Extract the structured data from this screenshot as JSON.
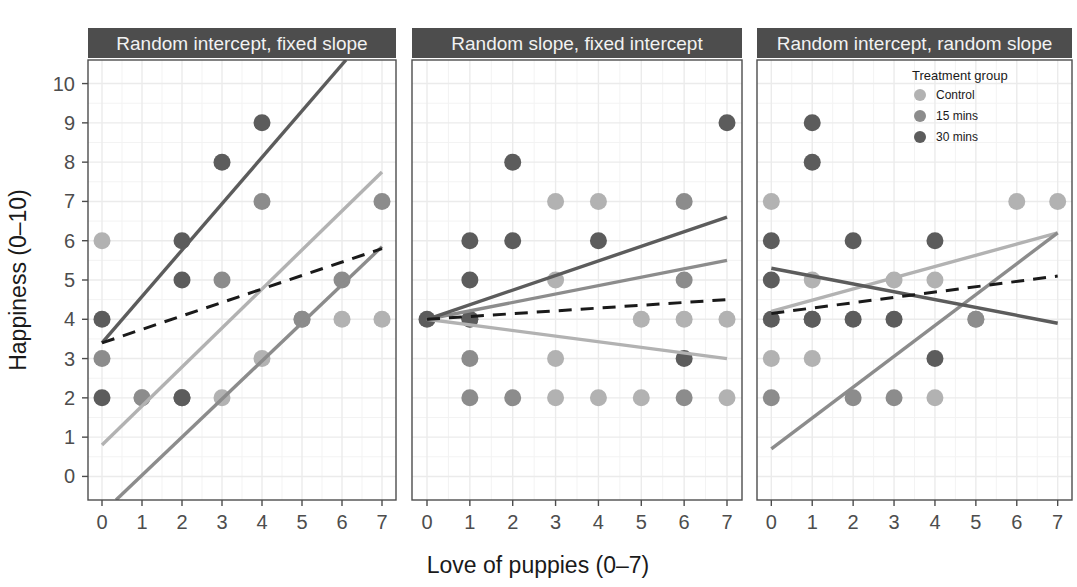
{
  "chart_data": {
    "type": "scatter",
    "title": "",
    "xlabel": "Love of puppies (0–7)",
    "ylabel": "Happiness (0–10)",
    "xlim": [
      -0.35,
      7.35
    ],
    "ylim": [
      -0.6,
      10.6
    ],
    "xticks": [
      0,
      1,
      2,
      3,
      4,
      5,
      6,
      7
    ],
    "yticks": [
      0,
      1,
      2,
      3,
      4,
      5,
      6,
      7,
      8,
      9,
      10
    ],
    "grid": true,
    "legend": {
      "position": "top-right-inside-panel-3",
      "title": "Treatment group",
      "entries": [
        {
          "label": "Control",
          "color": "#b2b2b2"
        },
        {
          "label": "15 mins",
          "color": "#8c8c8c"
        },
        {
          "label": "30 mins",
          "color": "#5c5c5c"
        }
      ]
    },
    "overall_line": {
      "label": "Overall fixed effect",
      "style": "dashed",
      "color": "#1a1a1a",
      "width": 3
    },
    "facets": [
      {
        "name": "panel-1",
        "title": "Random intercept, fixed slope",
        "series": [
          {
            "name": "Control",
            "color": "#b2b2b2",
            "points": [
              {
                "x": 0,
                "y": 6
              },
              {
                "x": 1,
                "y": 2
              },
              {
                "x": 2,
                "y": 2
              },
              {
                "x": 3,
                "y": 2
              },
              {
                "x": 4,
                "y": 3
              },
              {
                "x": 5,
                "y": 4
              },
              {
                "x": 6,
                "y": 4
              },
              {
                "x": 7,
                "y": 4
              }
            ],
            "line": {
              "x0": 0,
              "y0": 0.8,
              "x1": 7,
              "y1": 7.75
            }
          },
          {
            "name": "15 mins",
            "color": "#8c8c8c",
            "points": [
              {
                "x": 0,
                "y": 3
              },
              {
                "x": 1,
                "y": 2
              },
              {
                "x": 2,
                "y": 2
              },
              {
                "x": 3,
                "y": 5
              },
              {
                "x": 4,
                "y": 7
              },
              {
                "x": 5,
                "y": 4
              },
              {
                "x": 6,
                "y": 5
              },
              {
                "x": 7,
                "y": 7
              }
            ],
            "line": {
              "x0": 0.35,
              "y0": -0.6,
              "x1": 7,
              "y1": 5.85
            }
          },
          {
            "name": "30 mins",
            "color": "#5c5c5c",
            "points": [
              {
                "x": 0,
                "y": 4
              },
              {
                "x": 0,
                "y": 2
              },
              {
                "x": 2,
                "y": 6
              },
              {
                "x": 2,
                "y": 5
              },
              {
                "x": 3,
                "y": 8
              },
              {
                "x": 4,
                "y": 9
              },
              {
                "x": 2,
                "y": 2
              }
            ],
            "line": {
              "x0": 0,
              "y0": 3.4,
              "x1": 6.1,
              "y1": 10.6
            }
          }
        ],
        "overall": {
          "x0": 0,
          "y0": 3.4,
          "x1": 7,
          "y1": 5.8
        }
      },
      {
        "name": "panel-2",
        "title": "Random slope, fixed intercept",
        "series": [
          {
            "name": "Control",
            "color": "#b2b2b2",
            "points": [
              {
                "x": 1,
                "y": 4
              },
              {
                "x": 3,
                "y": 7
              },
              {
                "x": 4,
                "y": 7
              },
              {
                "x": 3,
                "y": 5
              },
              {
                "x": 5,
                "y": 4
              },
              {
                "x": 6,
                "y": 4
              },
              {
                "x": 7,
                "y": 4
              },
              {
                "x": 3,
                "y": 2
              },
              {
                "x": 4,
                "y": 2
              },
              {
                "x": 5,
                "y": 2
              },
              {
                "x": 7,
                "y": 2
              },
              {
                "x": 3,
                "y": 3
              }
            ],
            "line": {
              "x0": 0,
              "y0": 4.0,
              "x1": 7,
              "y1": 3.0
            }
          },
          {
            "name": "15 mins",
            "color": "#8c8c8c",
            "points": [
              {
                "x": 1,
                "y": 3
              },
              {
                "x": 6,
                "y": 7
              },
              {
                "x": 6,
                "y": 5
              },
              {
                "x": 2,
                "y": 2
              },
              {
                "x": 6,
                "y": 2
              },
              {
                "x": 1,
                "y": 2
              }
            ],
            "line": {
              "x0": 0,
              "y0": 4.0,
              "x1": 7,
              "y1": 5.5
            }
          },
          {
            "name": "30 mins",
            "color": "#5c5c5c",
            "points": [
              {
                "x": 0,
                "y": 4
              },
              {
                "x": 1,
                "y": 6
              },
              {
                "x": 1,
                "y": 5
              },
              {
                "x": 2,
                "y": 8
              },
              {
                "x": 2,
                "y": 6
              },
              {
                "x": 4,
                "y": 6
              },
              {
                "x": 7,
                "y": 9
              },
              {
                "x": 1,
                "y": 4
              },
              {
                "x": 6,
                "y": 3
              }
            ],
            "line": {
              "x0": 0,
              "y0": 4.0,
              "x1": 7,
              "y1": 6.6
            }
          }
        ],
        "overall": {
          "x0": 0,
          "y0": 4.0,
          "x1": 7,
          "y1": 4.5
        }
      },
      {
        "name": "panel-3",
        "title": "Random intercept, random slope",
        "series": [
          {
            "name": "Control",
            "color": "#b2b2b2",
            "points": [
              {
                "x": 0,
                "y": 7
              },
              {
                "x": 1,
                "y": 5
              },
              {
                "x": 3,
                "y": 5
              },
              {
                "x": 4,
                "y": 5
              },
              {
                "x": 6,
                "y": 7
              },
              {
                "x": 7,
                "y": 7
              },
              {
                "x": 0,
                "y": 3
              },
              {
                "x": 4,
                "y": 2
              },
              {
                "x": 5,
                "y": 4
              },
              {
                "x": 1,
                "y": 3
              }
            ],
            "line": {
              "x0": 0,
              "y0": 4.2,
              "x1": 7,
              "y1": 6.2
            }
          },
          {
            "name": "15 mins",
            "color": "#8c8c8c",
            "points": [
              {
                "x": 1,
                "y": 4
              },
              {
                "x": 2,
                "y": 2
              },
              {
                "x": 5,
                "y": 4
              },
              {
                "x": 0,
                "y": 2
              },
              {
                "x": 3,
                "y": 2
              }
            ],
            "line": {
              "x0": 0,
              "y0": 0.7,
              "x1": 7,
              "y1": 6.2
            }
          },
          {
            "name": "30 mins",
            "color": "#5c5c5c",
            "points": [
              {
                "x": 0,
                "y": 6
              },
              {
                "x": 1,
                "y": 9
              },
              {
                "x": 1,
                "y": 8
              },
              {
                "x": 2,
                "y": 6
              },
              {
                "x": 4,
                "y": 6
              },
              {
                "x": 0,
                "y": 4
              },
              {
                "x": 1,
                "y": 4
              },
              {
                "x": 2,
                "y": 4
              },
              {
                "x": 3,
                "y": 4
              },
              {
                "x": 4,
                "y": 3
              },
              {
                "x": 0,
                "y": 5
              }
            ],
            "line": {
              "x0": 0,
              "y0": 5.3,
              "x1": 7,
              "y1": 3.9
            }
          }
        ],
        "overall": {
          "x0": 0,
          "y0": 4.15,
          "x1": 7,
          "y1": 5.1
        }
      }
    ]
  }
}
